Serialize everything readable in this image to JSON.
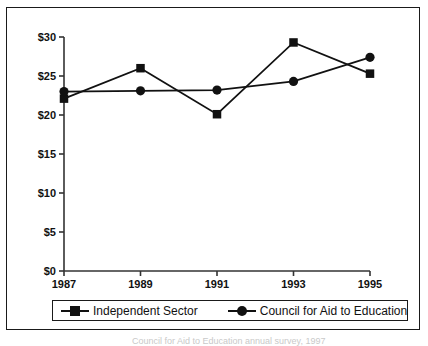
{
  "figure": {
    "background_color": "#ffffff",
    "frame_color": "#1a1a1a",
    "series_color": "#111111"
  },
  "legend": {
    "position": "below-plot",
    "entries": [
      {
        "label": "Independent Sector",
        "marker": "square-marker-icon"
      },
      {
        "label": "Council for Aid to Education",
        "marker": "circle-marker-icon"
      }
    ]
  },
  "caption": {
    "text": "Council for Aid to Education annual survey, 1997"
  },
  "chart_data": {
    "type": "line",
    "title": "",
    "subtitle": "",
    "xlabel": "",
    "ylabel": "",
    "x": [
      1987,
      1989,
      1991,
      1993,
      1995
    ],
    "categories": [
      "1987",
      "1989",
      "1991",
      "1993",
      "1995"
    ],
    "xtick_labels": [
      "1987",
      "1989",
      "1991",
      "1993",
      "1995"
    ],
    "ytick_labels": [
      "$0",
      "$5",
      "$10",
      "$15",
      "$20",
      "$25",
      "$30"
    ],
    "ytick_values": [
      0,
      5,
      10,
      15,
      20,
      25,
      30
    ],
    "ylim": [
      0,
      30
    ],
    "xlim": [
      1987,
      1995
    ],
    "grid": false,
    "legend_position": "bottom",
    "series": [
      {
        "name": "Independent Sector",
        "marker": "square",
        "values": [
          22.1,
          26.0,
          20.1,
          29.3,
          25.3
        ]
      },
      {
        "name": "Council for Aid to Education",
        "marker": "circle",
        "values": [
          23.0,
          23.1,
          23.2,
          24.3,
          27.4
        ]
      }
    ]
  }
}
